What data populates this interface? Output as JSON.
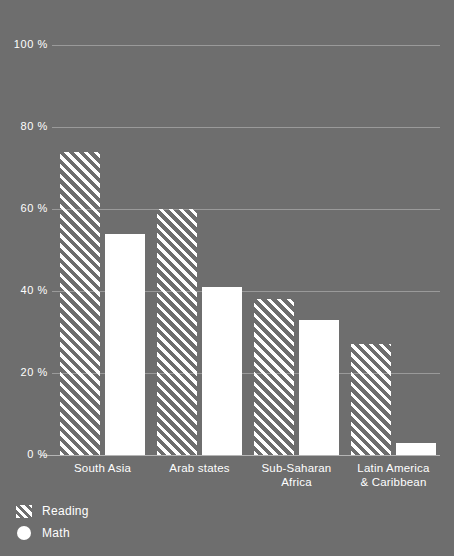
{
  "chart_data": {
    "type": "bar",
    "title": "",
    "subtitle": "",
    "xlabel": "",
    "ylabel": "",
    "ylim": [
      0,
      100
    ],
    "yticks": [
      0,
      20,
      40,
      60,
      80,
      100
    ],
    "ytick_labels": [
      "0 %",
      "20 %",
      "40 %",
      "60 %",
      "80 %",
      "100 %"
    ],
    "grid": true,
    "legend_position": "bottom-left",
    "categories": [
      "South Asia",
      "Arab states",
      "Sub-Saharan Africa",
      "Latin America & Caribbean"
    ],
    "category_label_lines": [
      [
        "South Asia"
      ],
      [
        "Arab states"
      ],
      [
        "Sub-Saharan",
        "Africa"
      ],
      [
        "Latin America",
        "& Caribbean"
      ]
    ],
    "series": [
      {
        "name": "Reading",
        "style": "hatched",
        "color": "#ffffff",
        "values": [
          74,
          60,
          38,
          27
        ]
      },
      {
        "name": "Math",
        "style": "solid",
        "color": "#ffffff",
        "values": [
          54,
          41,
          33,
          3
        ]
      }
    ]
  },
  "colors": {
    "background": "#6e6e6e",
    "gridline": "#9a9a9a",
    "baseline": "#b5b5b5",
    "ink": "#ffffff"
  },
  "legend": {
    "items": [
      {
        "label": "Reading",
        "swatch": "hatched-square-swatch"
      },
      {
        "label": "Math",
        "swatch": "filled-circle-swatch"
      }
    ]
  }
}
